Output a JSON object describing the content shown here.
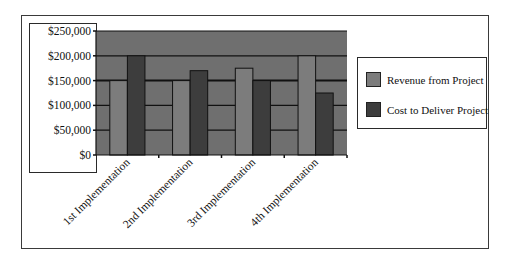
{
  "chart_data": {
    "type": "bar",
    "title": "",
    "xlabel": "",
    "ylabel": "",
    "categories": [
      "1st Implementation",
      "2nd Implementation",
      "3rd Implementation",
      "4th Implementation"
    ],
    "series": [
      {
        "name": "Revenue from Project",
        "values": [
          150000,
          150000,
          175000,
          200000
        ],
        "color": "#7c7c7c"
      },
      {
        "name": "Cost to Deliver Project",
        "values": [
          200000,
          170000,
          150000,
          125000
        ],
        "color": "#3d3d3d"
      }
    ],
    "ylim": [
      0,
      250000
    ],
    "yticks": [
      0,
      50000,
      100000,
      150000,
      200000,
      250000
    ],
    "ytick_labels": [
      "$0",
      "$50,000",
      "$100,000",
      "$150,000",
      "$200,000",
      "$250,000"
    ],
    "grid": true,
    "legend_position": "right",
    "plot_background": "#6f6f6f"
  },
  "legend": {
    "items": [
      {
        "label": "Revenue from Project",
        "color": "#7c7c7c"
      },
      {
        "label": "Cost to Deliver Project",
        "color": "#3d3d3d"
      }
    ]
  }
}
